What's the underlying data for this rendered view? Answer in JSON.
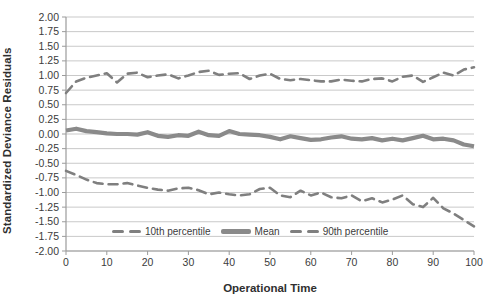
{
  "chart_data": {
    "type": "line",
    "title": "",
    "xlabel": "Operational Time",
    "ylabel": "Standardized Deviance Residuals",
    "xlim": [
      0,
      100
    ],
    "ylim": [
      -2.0,
      2.0
    ],
    "grid": "horizontal",
    "legend_position": "bottom-inside",
    "y_tick_labels": [
      "2.00",
      "1.75",
      "1.50",
      "1.25",
      "1.00",
      "0.75",
      "0.50",
      "0.25",
      "0.00",
      "-0.25",
      "-0.50",
      "-0.75",
      "-1.00",
      "-1.25",
      "-1.50",
      "-1.75",
      "-2.00"
    ],
    "x_tick_labels": [
      "0",
      "10",
      "20",
      "30",
      "40",
      "50",
      "60",
      "70",
      "80",
      "90",
      "100"
    ],
    "x": [
      0,
      2.5,
      5,
      7.5,
      10,
      12.5,
      15,
      17.5,
      20,
      22.5,
      25,
      27.5,
      30,
      32.5,
      35,
      37.5,
      40,
      42.5,
      45,
      47.5,
      50,
      52.5,
      55,
      57.5,
      60,
      62.5,
      65,
      67.5,
      70,
      72.5,
      75,
      77.5,
      80,
      82.5,
      85,
      87.5,
      90,
      92.5,
      95,
      97.5,
      100
    ],
    "series": [
      {
        "name": "10th percentile",
        "style": "dashed",
        "color": "#7f7f7f",
        "values": [
          -0.63,
          -0.7,
          -0.78,
          -0.84,
          -0.86,
          -0.86,
          -0.84,
          -0.88,
          -0.92,
          -0.95,
          -0.97,
          -0.93,
          -0.92,
          -0.96,
          -1.03,
          -1.0,
          -1.03,
          -1.05,
          -1.03,
          -0.94,
          -0.92,
          -1.05,
          -1.08,
          -0.97,
          -1.05,
          -1.0,
          -1.08,
          -1.1,
          -1.05,
          -1.15,
          -1.1,
          -1.17,
          -1.12,
          -1.05,
          -1.2,
          -1.25,
          -1.09,
          -1.27,
          -1.36,
          -1.47,
          -1.58
        ]
      },
      {
        "name": "Mean",
        "style": "solid-thick",
        "color": "#8a8a8a",
        "values": [
          0.06,
          0.09,
          0.05,
          0.03,
          0.01,
          0.0,
          0.0,
          -0.01,
          0.03,
          -0.03,
          -0.05,
          -0.02,
          -0.03,
          0.04,
          -0.02,
          -0.03,
          0.05,
          0.0,
          -0.01,
          -0.02,
          -0.05,
          -0.09,
          -0.04,
          -0.07,
          -0.1,
          -0.09,
          -0.06,
          -0.04,
          -0.08,
          -0.09,
          -0.07,
          -0.11,
          -0.08,
          -0.11,
          -0.07,
          -0.03,
          -0.09,
          -0.08,
          -0.11,
          -0.18,
          -0.21
        ]
      },
      {
        "name": "90th percentile",
        "style": "dashed",
        "color": "#7f7f7f",
        "values": [
          0.7,
          0.9,
          0.96,
          1.0,
          1.04,
          0.88,
          1.03,
          1.05,
          0.97,
          1.0,
          1.02,
          0.95,
          1.0,
          1.06,
          1.08,
          1.01,
          1.03,
          1.04,
          0.94,
          1.0,
          1.03,
          0.94,
          0.92,
          0.94,
          0.92,
          0.9,
          0.9,
          0.93,
          0.91,
          0.9,
          0.94,
          0.95,
          0.9,
          0.98,
          1.0,
          0.89,
          0.97,
          1.05,
          1.0,
          1.1,
          1.14
        ]
      }
    ],
    "colors": {
      "gridline": "#c9c9c9",
      "axis": "#9b9b9b",
      "tick_label": "#3b3b3b",
      "title": "#2f2f2f"
    }
  }
}
